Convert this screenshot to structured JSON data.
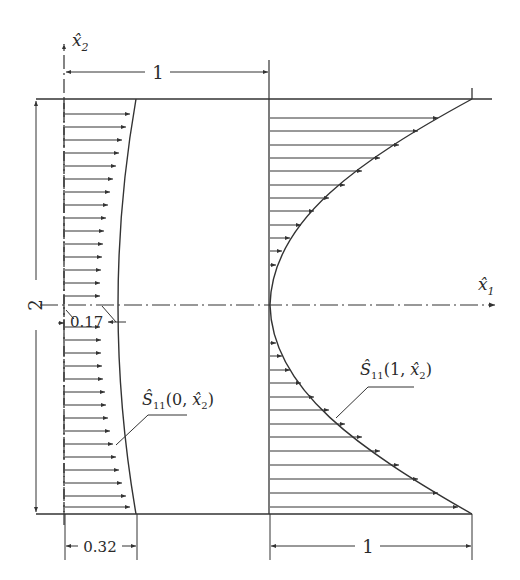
{
  "figure": {
    "type": "stress-distribution-diagram",
    "axes": {
      "x1_label": "x̂",
      "x1_sub": "1",
      "x2_label": "x̂",
      "x2_sub": "2"
    },
    "dimensions": {
      "top_width": "1",
      "height": "2",
      "min_left": "0.17",
      "left_edge_value": "0.32",
      "right_edge_value": "1"
    },
    "curves": {
      "left": {
        "prefix": "Ŝ",
        "sub": "11",
        "args": "(0, x̂",
        "args_sub": "2",
        "close": ")"
      },
      "right": {
        "prefix": "Ŝ",
        "sub": "11",
        "args": "(1, x̂",
        "args_sub": "2",
        "close": ")"
      }
    },
    "colors": {
      "line": "#3a3a3a",
      "background": "#ffffff"
    }
  }
}
